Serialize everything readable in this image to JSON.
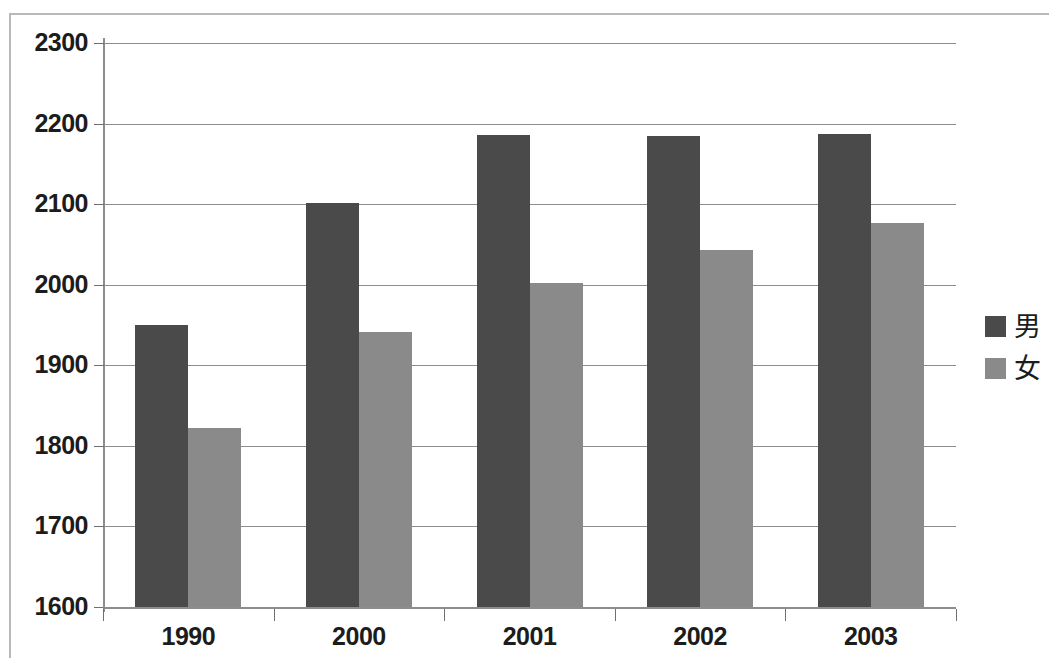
{
  "chart_data": {
    "type": "bar",
    "title": "",
    "xlabel": "",
    "ylabel": "",
    "categories": [
      "1990",
      "2000",
      "2001",
      "2002",
      "2003"
    ],
    "series": [
      {
        "name": "男",
        "color": "#4a4a4a",
        "values": [
          1950,
          2101,
          2186,
          2185,
          2187
        ]
      },
      {
        "name": "女",
        "color": "#8a8a8a",
        "values": [
          1822,
          1941,
          2002,
          2043,
          2077
        ]
      }
    ],
    "ylim": [
      1600,
      2300
    ],
    "ytick_labels": [
      "2300",
      "2200",
      "2100",
      "2000",
      "1900",
      "1800",
      "1700",
      "1600"
    ],
    "ytick_values": [
      2300,
      2200,
      2100,
      2000,
      1900,
      1800,
      1700,
      1600
    ],
    "grid": true,
    "legend_position": "right",
    "legend": [
      {
        "label": "男",
        "color": "#4a4a4a"
      },
      {
        "label": "女",
        "color": "#8a8a8a"
      }
    ]
  }
}
